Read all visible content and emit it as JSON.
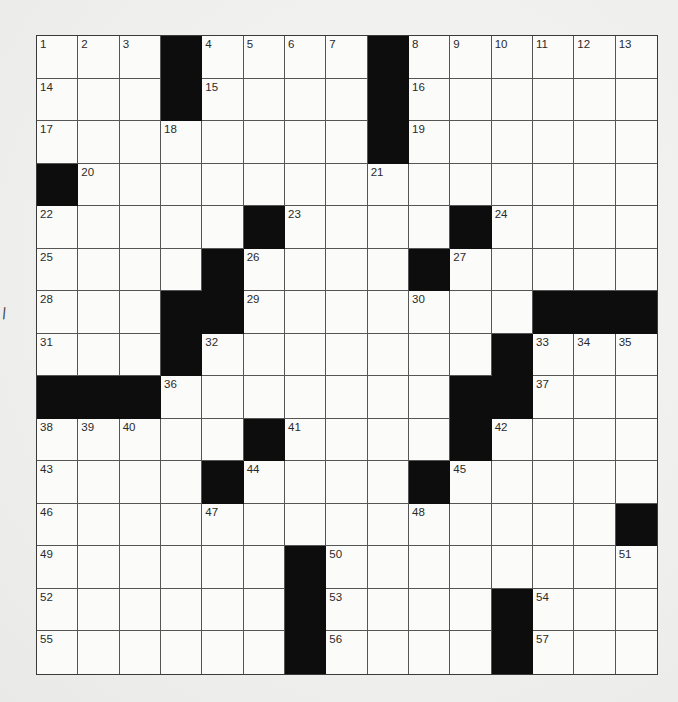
{
  "puzzle": {
    "rows": 15,
    "cols": 15,
    "stray_mark": "/",
    "colors": {
      "block": "#0d0d0d",
      "cell": "#fbfbfa",
      "line": "#555555",
      "paper": "#f1f1ef"
    },
    "grid": [
      [
        "1",
        "2",
        "3",
        "#",
        "4",
        "5",
        "6",
        "7",
        "#",
        "8",
        "9",
        "10",
        "11",
        "12",
        "13"
      ],
      [
        "14",
        "",
        "",
        "#",
        "15",
        "",
        "",
        "",
        "#",
        "16",
        "",
        "",
        "",
        "",
        ""
      ],
      [
        "17",
        "",
        "",
        "18",
        "",
        "",
        "",
        "",
        "#",
        "19",
        "",
        "",
        "",
        "",
        ""
      ],
      [
        "#",
        "20",
        "",
        "",
        "",
        "",
        "",
        "",
        "21",
        "",
        "",
        "",
        "",
        "",
        ""
      ],
      [
        "22",
        "",
        "",
        "",
        "",
        "#",
        "23",
        "",
        "",
        "",
        "#",
        "24",
        "",
        "",
        ""
      ],
      [
        "25",
        "",
        "",
        "",
        "#",
        "26",
        "",
        "",
        "",
        "#",
        "27",
        "",
        "",
        "",
        ""
      ],
      [
        "28",
        "",
        "",
        "#",
        "#",
        "29",
        "",
        "",
        "",
        "30",
        "",
        "",
        "#",
        "#",
        "#"
      ],
      [
        "31",
        "",
        "",
        "#",
        "32",
        "",
        "",
        "",
        "",
        "",
        "",
        "#",
        "33",
        "34",
        "35"
      ],
      [
        "#",
        "#",
        "#",
        "36",
        "",
        "",
        "",
        "",
        "",
        "",
        "#",
        "#",
        "37",
        "",
        ""
      ],
      [
        "38",
        "39",
        "40",
        "",
        "",
        "#",
        "41",
        "",
        "",
        "",
        "#",
        "42",
        "",
        "",
        ""
      ],
      [
        "43",
        "",
        "",
        "",
        "#",
        "44",
        "",
        "",
        "",
        "#",
        "45",
        "",
        "",
        "",
        ""
      ],
      [
        "46",
        "",
        "",
        "",
        "47",
        "",
        "",
        "",
        "",
        "48",
        "",
        "",
        "",
        "",
        "#"
      ],
      [
        "49",
        "",
        "",
        "",
        "",
        "",
        "#",
        "50",
        "",
        "",
        "",
        "",
        "",
        "",
        "51"
      ],
      [
        "52",
        "",
        "",
        "",
        "",
        "",
        "#",
        "53",
        "",
        "",
        "",
        "#",
        "54",
        "",
        ""
      ],
      [
        "55",
        "",
        "",
        "",
        "",
        "",
        "#",
        "56",
        "",
        "",
        "",
        "#",
        "57",
        "",
        ""
      ]
    ]
  }
}
